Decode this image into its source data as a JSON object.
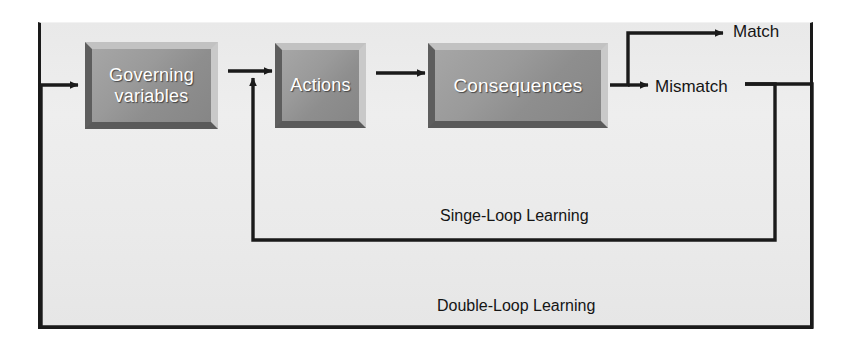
{
  "diagram": {
    "type": "flow-diagram",
    "panel": {
      "background_color": "#eaeaea",
      "border_color": "#1a1a1a"
    },
    "boxes": [
      {
        "id": "governing",
        "label": "Governing\nvariables",
        "line1": "Governing",
        "line2": "variables",
        "fill_color": "#949494",
        "text_color": "#ffffff"
      },
      {
        "id": "actions",
        "label": "Actions",
        "fill_color": "#949494",
        "text_color": "#ffffff"
      },
      {
        "id": "consequences",
        "label": "Consequences",
        "fill_color": "#949494",
        "text_color": "#ffffff"
      }
    ],
    "outcomes": [
      {
        "id": "match",
        "label": "Match",
        "text_color": "#151515"
      },
      {
        "id": "mismatch",
        "label": "Mismatch",
        "text_color": "#151515"
      }
    ],
    "loops": [
      {
        "id": "single-loop",
        "label": "Singe-Loop Learning",
        "from": "mismatch",
        "to": "actions",
        "line_color": "#1a1a1a"
      },
      {
        "id": "double-loop",
        "label": "Double-Loop Learning",
        "from": "mismatch",
        "to": "governing",
        "line_color": "#1a1a1a"
      }
    ],
    "connectors": [
      {
        "id": "governing-to-actions",
        "from": "governing",
        "to": "actions"
      },
      {
        "id": "actions-to-consequences",
        "from": "actions",
        "to": "consequences"
      },
      {
        "id": "consequences-to-match",
        "from": "consequences",
        "to": "match"
      },
      {
        "id": "consequences-to-mismatch",
        "from": "consequences",
        "to": "mismatch"
      }
    ]
  }
}
